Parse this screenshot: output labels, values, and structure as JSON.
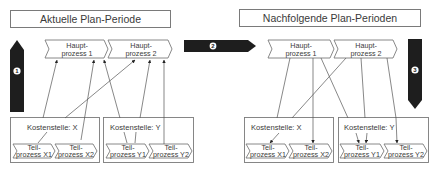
{
  "colors": {
    "stroke": "#7a7a7a",
    "line": "#555555",
    "arrow_fill": "#1e1e1e",
    "text": "#3a3a3a",
    "badge": "#ffffff"
  },
  "left_panel": {
    "title": "Aktuelle Plan-Periode",
    "main_processes": [
      {
        "line1": "Haupt-",
        "line2": "prozess 1"
      },
      {
        "line1": "Haupt-",
        "line2": "prozess 2"
      }
    ],
    "cost_centers": [
      {
        "label": "Kostenstelle: X",
        "sub_processes": [
          {
            "line1": "Teil-",
            "line2": "prozess X1"
          },
          {
            "line1": "Teil-",
            "line2": "prozess X2"
          }
        ]
      },
      {
        "label": "Kostenstelle: Y",
        "sub_processes": [
          {
            "line1": "Teil-",
            "line2": "prozess Y1"
          },
          {
            "line1": "Teil-",
            "line2": "prozess Y2"
          }
        ]
      }
    ]
  },
  "right_panel": {
    "title": "Nachfolgende Plan-Perioden",
    "main_processes": [
      {
        "line1": "Haupt-",
        "line2": "prozess 1"
      },
      {
        "line1": "Haupt-",
        "line2": "prozess 2"
      }
    ],
    "cost_centers": [
      {
        "label": "Kostenstelle: X",
        "sub_processes": [
          {
            "line1": "Teil-",
            "line2": "prozess X1"
          },
          {
            "line1": "Teil-",
            "line2": "prozess X2"
          }
        ]
      },
      {
        "label": "Kostenstelle: Y",
        "sub_processes": [
          {
            "line1": "Teil-",
            "line2": "prozess Y1"
          },
          {
            "line1": "Teil-",
            "line2": "prozess Y2"
          }
        ]
      }
    ]
  },
  "step_arrows": [
    {
      "number": "1",
      "direction": "up"
    },
    {
      "number": "2",
      "direction": "right"
    },
    {
      "number": "3",
      "direction": "down"
    }
  ]
}
